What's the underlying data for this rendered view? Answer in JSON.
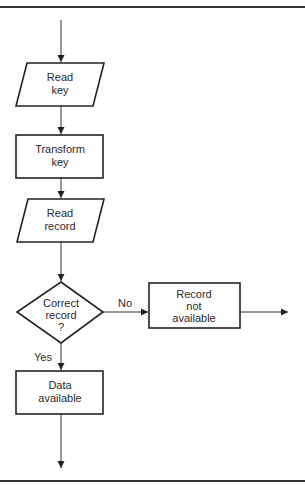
{
  "diagram": {
    "type": "flowchart",
    "nodes": [
      {
        "id": "read_key",
        "shape": "parallelogram",
        "lines": [
          "Read",
          "key"
        ]
      },
      {
        "id": "transform_key",
        "shape": "rectangle",
        "lines": [
          "Transform",
          "key"
        ]
      },
      {
        "id": "read_record",
        "shape": "parallelogram",
        "lines": [
          "Read",
          "record"
        ]
      },
      {
        "id": "correct_record",
        "shape": "diamond",
        "lines": [
          "Correct",
          "record",
          "?"
        ]
      },
      {
        "id": "record_not_available",
        "shape": "rectangle",
        "lines": [
          "Record",
          "not",
          "available"
        ]
      },
      {
        "id": "data_available",
        "shape": "rectangle",
        "lines": [
          "Data",
          "available"
        ]
      }
    ],
    "edges": [
      {
        "from": "start",
        "to": "read_key",
        "label": ""
      },
      {
        "from": "read_key",
        "to": "transform_key",
        "label": ""
      },
      {
        "from": "transform_key",
        "to": "read_record",
        "label": ""
      },
      {
        "from": "read_record",
        "to": "correct_record",
        "label": ""
      },
      {
        "from": "correct_record",
        "to": "record_not_available",
        "label": "No"
      },
      {
        "from": "correct_record",
        "to": "data_available",
        "label": "Yes"
      },
      {
        "from": "record_not_available",
        "to": "exit_right",
        "label": ""
      },
      {
        "from": "data_available",
        "to": "exit_bottom",
        "label": ""
      }
    ],
    "labels": {
      "no": "No",
      "yes": "Yes"
    }
  }
}
